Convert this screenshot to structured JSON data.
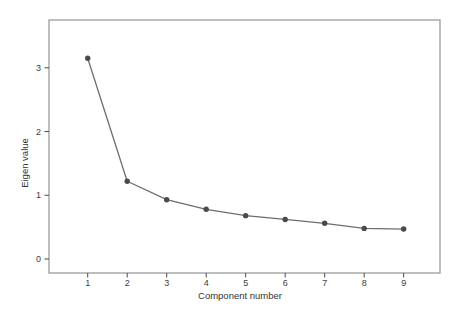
{
  "chart_data": {
    "type": "line",
    "title": "",
    "xlabel": "Component number",
    "ylabel": "Eigen value",
    "categories": [
      1,
      2,
      3,
      4,
      5,
      6,
      7,
      8,
      9
    ],
    "series": [
      {
        "name": "Eigenvalues",
        "values": [
          3.15,
          1.22,
          0.93,
          0.78,
          0.68,
          0.62,
          0.56,
          0.48,
          0.47
        ]
      }
    ],
    "xticks": [
      "1",
      "2",
      "3",
      "4",
      "5",
      "6",
      "7",
      "8",
      "9"
    ],
    "yticks": [
      "0",
      "1",
      "2",
      "3"
    ],
    "xlim": [
      0.02,
      9.92
    ],
    "ylim": [
      -0.22,
      3.75
    ],
    "grid": false,
    "legend": null,
    "marker": "circle",
    "colors": {
      "background": "#ffffff",
      "plot_border": "#9c9c9c",
      "line": "#6e6e6e",
      "marker": "#4a4a4a",
      "tick": "#4a4a4a",
      "tick_text": "#3d3d3d",
      "axis_title_text": "#333333"
    }
  }
}
